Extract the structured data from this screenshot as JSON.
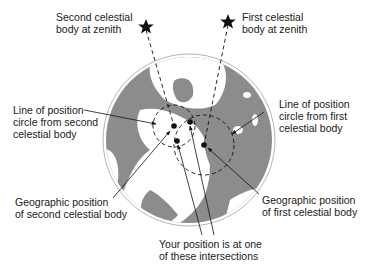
{
  "diagram": {
    "type": "celestial-navigation-lines-of-position",
    "colors": {
      "land": "#8c8c8c",
      "ocean": "#ffffff",
      "globe_outline": "#b5b5b5",
      "ink": "#111111"
    },
    "labels": {
      "second_zenith": "Second celestial\nbody at zenith",
      "first_zenith": "First celestial\nbody at zenith",
      "lop_second": "Line of position\ncircle from second\ncelestial body",
      "lop_first": "Line of position\ncircle from first\ncelestial body",
      "gp_second": "Geographic position\nof second celestial body",
      "gp_first": "Geographic position\nof first celestial body",
      "your_position": "Your position is at one\nof these intersections"
    },
    "icons": {
      "star_second": "star-icon",
      "star_first": "star-icon"
    }
  }
}
